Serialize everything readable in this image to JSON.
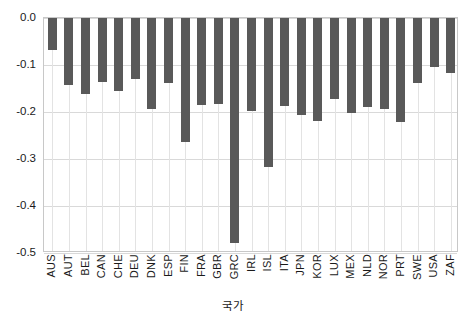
{
  "chart_data": {
    "type": "bar",
    "title": "",
    "xlabel": "국가",
    "ylabel": "",
    "ylim": [
      -0.5,
      0.0
    ],
    "grid": true,
    "legend": "none",
    "bar_color": "#595959",
    "y_ticks": [
      "0.0",
      "-0.1",
      "-0.2",
      "-0.3",
      "-0.4",
      "-0.5"
    ],
    "y_tick_values": [
      0.0,
      -0.1,
      -0.2,
      -0.3,
      -0.4,
      -0.5
    ],
    "categories": [
      "AUS",
      "AUT",
      "BEL",
      "CAN",
      "CHE",
      "DEU",
      "DNK",
      "ESP",
      "FIN",
      "FRA",
      "GBR",
      "GRC",
      "IRL",
      "ISL",
      "ITA",
      "JPN",
      "KOR",
      "LUX",
      "MEX",
      "NLD",
      "NOR",
      "PRT",
      "SWE",
      "USA",
      "ZAF"
    ],
    "values": [
      -0.069,
      -0.143,
      -0.162,
      -0.136,
      -0.155,
      -0.13,
      -0.193,
      -0.138,
      -0.263,
      -0.185,
      -0.182,
      -0.478,
      -0.198,
      -0.317,
      -0.188,
      -0.207,
      -0.219,
      -0.172,
      -0.203,
      -0.19,
      -0.193,
      -0.221,
      -0.138,
      -0.104,
      -0.116
    ]
  }
}
